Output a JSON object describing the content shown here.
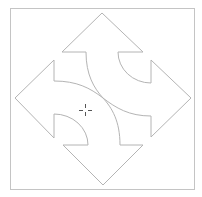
{
  "diagram": {
    "title": "",
    "colors": {
      "background": "#ffffff",
      "stroke": "#b4b4b4",
      "frame": "#c4c4c4",
      "cursor": "#555555"
    },
    "frame": {
      "x": 10,
      "y": 8,
      "width": 184,
      "height": 181
    },
    "arrows": [
      {
        "direction": "up",
        "apex": [
          102,
          13
        ]
      },
      {
        "direction": "left",
        "apex": [
          15,
          98
        ]
      },
      {
        "direction": "right",
        "apex": [
          191,
          98
        ]
      },
      {
        "direction": "down",
        "apex": [
          103,
          185
        ]
      }
    ],
    "cursor": {
      "type": "crosshair-icon",
      "x": 85,
      "y": 110
    }
  }
}
